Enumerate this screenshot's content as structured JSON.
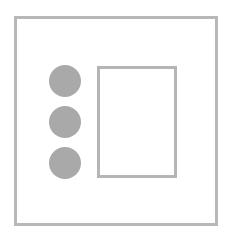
{
  "diagram": {
    "colors": {
      "frame_border": "#b8b8b8",
      "circle_fill": "#a9a9a9",
      "panel_border": "#b5b5b5",
      "background": "#ffffff"
    },
    "circles": [
      {
        "id": "circle-1",
        "cx": 65,
        "cy": 81,
        "r": 16
      },
      {
        "id": "circle-2",
        "cx": 65,
        "cy": 122,
        "r": 16
      },
      {
        "id": "circle-3",
        "cx": 65,
        "cy": 163,
        "r": 16
      }
    ],
    "panel": {
      "x": 97,
      "y": 66,
      "width": 80,
      "height": 112
    }
  }
}
